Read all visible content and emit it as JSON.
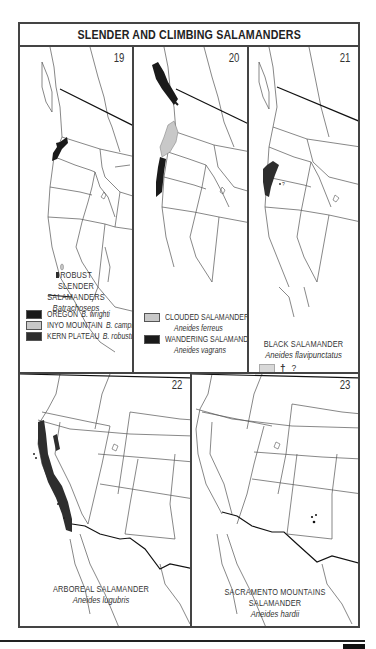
{
  "title": "SLENDER AND CLIMBING SALAMANDERS",
  "colors": {
    "outline": "#444444",
    "range_black": "#1a1a1a",
    "range_dark": "#2e2e2e",
    "range_gray": "#c8c8c8"
  },
  "maps": [
    {
      "number": "19",
      "caption_lines": [
        "ROBUST",
        "SLENDER SALAMANDERS"
      ],
      "scientific": "Batrachoseps",
      "legend": [
        {
          "swatch": "#1a1a1a",
          "label": "OREGON",
          "scientific": "B. wrighti"
        },
        {
          "swatch": "#c8c8c8",
          "label": "INYO MOUNTAIN",
          "scientific": "B. campi"
        },
        {
          "swatch": "#2e2e2e",
          "label": "KERN PLATEAU",
          "scientific": "B. robustus"
        }
      ]
    },
    {
      "number": "20",
      "legend": [
        {
          "swatch": "#c8c8c8",
          "label": "CLOUDED SALAMANDER",
          "scientific": "Aneides ferreus"
        },
        {
          "swatch": "#1a1a1a",
          "label": "WANDERING SALAMANDER",
          "scientific": "Aneides vagrans"
        }
      ]
    },
    {
      "number": "21",
      "name": "BLACK SALAMANDER",
      "scientific": "Aneides flavipunctatus",
      "legend_extra": {
        "swatch": "#d8d8d8",
        "symbol": "†",
        "symbol_note": "?"
      }
    },
    {
      "number": "22",
      "name": "ARBOREAL SALAMANDER",
      "scientific": "Aneides lugubris"
    },
    {
      "number": "23",
      "name": "SACRAMENTO MOUNTAINS SALAMANDER",
      "scientific": "Aneides hardii"
    }
  ]
}
